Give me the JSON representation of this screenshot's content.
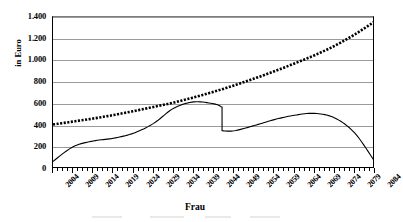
{
  "axis": {
    "y_title": "in Euro",
    "x_title": "Frau",
    "y_ticks": [
      "1.400",
      "1.200",
      "1.000",
      "800",
      "600",
      "400",
      "200",
      "0"
    ],
    "x_ticks": [
      "2004",
      "2009",
      "2014",
      "2019",
      "2024",
      "2029",
      "2034",
      "2039",
      "2044",
      "2049",
      "2054",
      "2059",
      "2064",
      "2069",
      "2074",
      "2079",
      "2084"
    ]
  },
  "colors": {
    "series_thick": "#000000",
    "series_thin": "#000000",
    "gridline": "#9a9a9a",
    "axis": "#000000",
    "background": "#ffffff"
  },
  "chart_data": {
    "type": "line",
    "title": "",
    "xlabel": "Frau",
    "ylabel": "in Euro",
    "xlim": [
      2004,
      2084
    ],
    "ylim": [
      0,
      1400
    ],
    "ytick_step": 200,
    "grid": true,
    "legend": "none",
    "x": [
      2004,
      2009,
      2014,
      2019,
      2024,
      2029,
      2034,
      2039,
      2044,
      2049,
      2054,
      2059,
      2064,
      2069,
      2074,
      2079,
      2084
    ],
    "series": [
      {
        "name": "Serie 1",
        "marker": "square",
        "style": "thick-dotted",
        "values": [
          410,
          437,
          465,
          497,
          533,
          572,
          612,
          660,
          712,
          770,
          833,
          900,
          972,
          1048,
          1135,
          1240,
          1360
        ]
      },
      {
        "name": "Serie 2",
        "marker": "none",
        "style": "thin-solid",
        "values": [
          70,
          205,
          258,
          283,
          330,
          420,
          560,
          618,
          600,
          352,
          400,
          455,
          495,
          512,
          470,
          330,
          65
        ]
      }
    ],
    "annotations": [
      {
        "type": "discontinuity",
        "x": 2046,
        "from": 570,
        "to": 352,
        "note": "abrupter Abfall"
      }
    ]
  }
}
